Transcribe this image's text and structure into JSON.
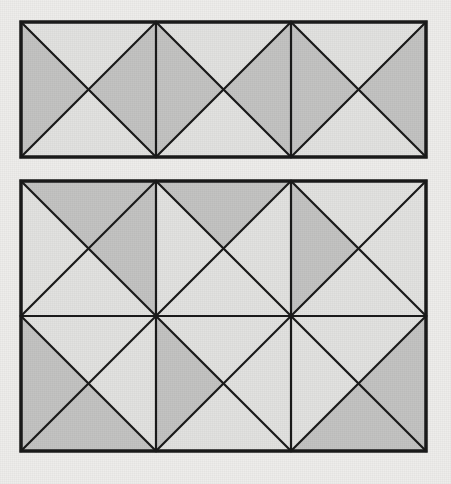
{
  "page": {
    "background_color": "#eeedeb"
  },
  "palette": {
    "paper": "#eeedeb",
    "stroke": "#1a1a1a",
    "light_fill": "#e2e2e0",
    "dark_fill": "#c3c3c2"
  },
  "figures": [
    {
      "id": "figure-top",
      "label": "Figure 1",
      "caption": "",
      "rows": 1,
      "cols": 3,
      "cell_size": 135,
      "x": 0,
      "y": 0,
      "stroke_width_border": 3.5,
      "stroke_width_inner": 2.2,
      "cells": [
        {
          "row": 0,
          "col": 0,
          "top": "light",
          "right": "dark",
          "bottom": "light",
          "left": "dark"
        },
        {
          "row": 0,
          "col": 1,
          "top": "light",
          "right": "dark",
          "bottom": "light",
          "left": "dark"
        },
        {
          "row": 0,
          "col": 2,
          "top": "light",
          "right": "dark",
          "bottom": "light",
          "left": "dark"
        }
      ]
    },
    {
      "id": "figure-bottom",
      "label": "Figure 2",
      "caption": "",
      "rows": 2,
      "cols": 3,
      "cell_size": 135,
      "x": 0,
      "y": 0,
      "stroke_width_border": 3.5,
      "stroke_width_inner": 2.2,
      "cells": [
        {
          "row": 0,
          "col": 0,
          "top": "dark",
          "right": "dark",
          "bottom": "light",
          "left": "light"
        },
        {
          "row": 0,
          "col": 1,
          "top": "dark",
          "right": "light",
          "bottom": "light",
          "left": "light"
        },
        {
          "row": 0,
          "col": 2,
          "top": "light",
          "right": "light",
          "bottom": "light",
          "left": "dark"
        },
        {
          "row": 1,
          "col": 0,
          "top": "light",
          "right": "light",
          "bottom": "dark",
          "left": "dark"
        },
        {
          "row": 1,
          "col": 1,
          "top": "light",
          "right": "light",
          "bottom": "light",
          "left": "dark"
        },
        {
          "row": 1,
          "col": 2,
          "top": "light",
          "right": "dark",
          "bottom": "dark",
          "left": "light"
        }
      ]
    }
  ]
}
